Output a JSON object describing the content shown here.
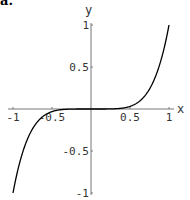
{
  "corner_label": "a.",
  "chart_data": {
    "type": "line",
    "title": "",
    "function": "y = x^5",
    "xlabel": "x",
    "ylabel": "y",
    "xlim": [
      -1,
      1
    ],
    "ylim": [
      -1,
      1
    ],
    "grid": false,
    "legend": null,
    "x_ticks": [
      "-1",
      "-0.5",
      "0.5",
      "1"
    ],
    "y_ticks": [
      "1",
      "0.5",
      "-0.5",
      "-1"
    ],
    "series": [
      {
        "name": "x^5",
        "x": [
          -1,
          -0.9,
          -0.8,
          -0.7,
          -0.6,
          -0.5,
          -0.4,
          -0.3,
          -0.2,
          -0.1,
          0,
          0.1,
          0.2,
          0.3,
          0.4,
          0.5,
          0.6,
          0.7,
          0.8,
          0.9,
          1
        ],
        "y": [
          -1,
          -0.59,
          -0.328,
          -0.168,
          -0.078,
          -0.031,
          -0.01,
          -0.002,
          0,
          0,
          0,
          0,
          0,
          0.002,
          0.01,
          0.031,
          0.078,
          0.168,
          0.328,
          0.59,
          1
        ]
      }
    ]
  }
}
